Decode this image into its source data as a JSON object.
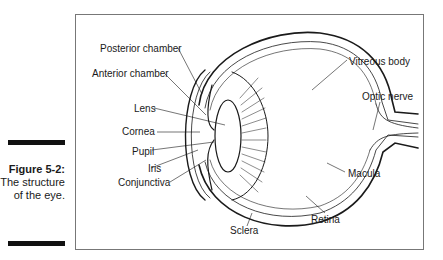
{
  "figure": {
    "number": "Figure 5-2:",
    "caption": "The structure of the eye."
  },
  "diagram": {
    "labels": [
      {
        "id": "posterior-chamber",
        "text": "Posterior chamber"
      },
      {
        "id": "anterior-chamber",
        "text": "Anterior chamber"
      },
      {
        "id": "lens",
        "text": "Lens"
      },
      {
        "id": "cornea",
        "text": "Cornea"
      },
      {
        "id": "pupil",
        "text": "Pupil"
      },
      {
        "id": "iris",
        "text": "Iris"
      },
      {
        "id": "conjunctiva",
        "text": "Conjunctiva"
      },
      {
        "id": "vitreous-body",
        "text": "Vitreous body"
      },
      {
        "id": "optic-nerve",
        "text": "Optic nerve"
      },
      {
        "id": "macula",
        "text": "Macula"
      },
      {
        "id": "retina",
        "text": "Retina"
      },
      {
        "id": "sclera",
        "text": "Sclera"
      }
    ]
  }
}
